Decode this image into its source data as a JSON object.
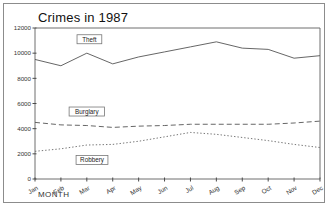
{
  "window": {
    "background_color": "#ffffff",
    "frame_color": "#8c8c8c"
  },
  "chart_data": {
    "type": "line",
    "title": "Crimes in 1987",
    "xlabel": "MONTH",
    "ylabel": "",
    "categories": [
      "Jan",
      "Feb",
      "Mar",
      "Apr",
      "May",
      "Jun",
      "Jul",
      "Aug",
      "Sep",
      "Oct",
      "Nov",
      "Dec"
    ],
    "ylim": [
      0,
      12000
    ],
    "yticks": [
      0,
      2000,
      4000,
      6000,
      8000,
      10000,
      12000
    ],
    "ytick_labels": [
      "0",
      "2000",
      "4000",
      "6000",
      "8000",
      "10000",
      "12000"
    ],
    "grid": false,
    "legend": "inline-labels",
    "series": [
      {
        "name": "Theft",
        "style": "solid",
        "color": "#555555",
        "values": [
          9500,
          9000,
          10000,
          9150,
          9700,
          10100,
          10500,
          10900,
          10400,
          10300,
          9600,
          9800
        ]
      },
      {
        "name": "Burglary",
        "style": "dashed",
        "color": "#555555",
        "values": [
          4500,
          4300,
          4250,
          4100,
          4200,
          4250,
          4350,
          4350,
          4350,
          4350,
          4450,
          4600
        ]
      },
      {
        "name": "Robbery",
        "style": "dotted",
        "color": "#666666",
        "values": [
          2200,
          2400,
          2700,
          2750,
          3000,
          3350,
          3700,
          3550,
          3300,
          3050,
          2750,
          2500
        ]
      }
    ]
  }
}
